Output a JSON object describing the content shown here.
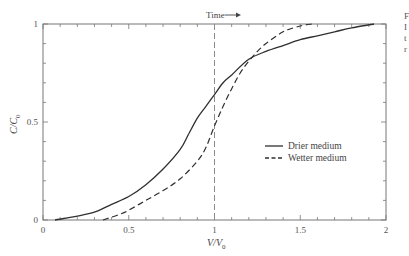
{
  "chart_data": {
    "type": "line",
    "title": "",
    "xlabel": "V/V0",
    "ylabel": "C/C0",
    "xlim": [
      0,
      2
    ],
    "ylim": [
      0,
      1
    ],
    "x_ticks": [
      "0",
      "0.5",
      "1",
      "1.5",
      "2"
    ],
    "y_ticks": [
      "0",
      "0.5",
      "1"
    ],
    "x_minor_step": 0.1,
    "y_minor_step": 0.1,
    "grid": false,
    "legend_position": "center-right",
    "annotations": [
      {
        "text": "Time →",
        "x": 1.0,
        "y": 1.0,
        "position": "above plot"
      },
      {
        "type": "vertical-dashed-line",
        "x": 1.0
      }
    ],
    "series": [
      {
        "name": "Drier medium",
        "style": "solid",
        "x": [
          0.07,
          0.2,
          0.3,
          0.4,
          0.5,
          0.6,
          0.7,
          0.8,
          0.85,
          0.9,
          0.95,
          1.0,
          1.05,
          1.1,
          1.2,
          1.3,
          1.4,
          1.5,
          1.6,
          1.7,
          1.8,
          1.93
        ],
        "values": [
          0.0,
          0.02,
          0.04,
          0.08,
          0.12,
          0.18,
          0.26,
          0.36,
          0.44,
          0.52,
          0.58,
          0.64,
          0.7,
          0.74,
          0.82,
          0.86,
          0.89,
          0.92,
          0.94,
          0.96,
          0.98,
          1.0
        ]
      },
      {
        "name": "Wetter medium",
        "style": "dashed",
        "x": [
          0.35,
          0.45,
          0.5,
          0.6,
          0.7,
          0.8,
          0.9,
          0.95,
          1.0,
          1.05,
          1.1,
          1.15,
          1.2,
          1.25,
          1.3,
          1.4,
          1.5,
          1.57
        ],
        "values": [
          0.0,
          0.03,
          0.05,
          0.1,
          0.15,
          0.21,
          0.3,
          0.37,
          0.48,
          0.58,
          0.67,
          0.75,
          0.81,
          0.86,
          0.9,
          0.96,
          0.99,
          1.0
        ]
      }
    ]
  },
  "labels": {
    "time_annotation": "Time",
    "x_axis_main": "V/V",
    "x_axis_sub": "0",
    "y_axis_main": "C/C",
    "y_axis_sub": "0",
    "legend_drier": "Drier medium",
    "legend_wetter": "Wetter medium",
    "x_tick_0": "0",
    "x_tick_1": "0.5",
    "x_tick_2": "1",
    "x_tick_3": "1.5",
    "x_tick_4": "2",
    "y_tick_0": "0",
    "y_tick_1": "0.5",
    "y_tick_2": "1"
  },
  "edge_fragments": [
    "F",
    "I",
    "t",
    "r"
  ],
  "colors": {
    "axis": "#666666",
    "line": "#2f2f2f",
    "reference_line": "#8a8a8a"
  }
}
